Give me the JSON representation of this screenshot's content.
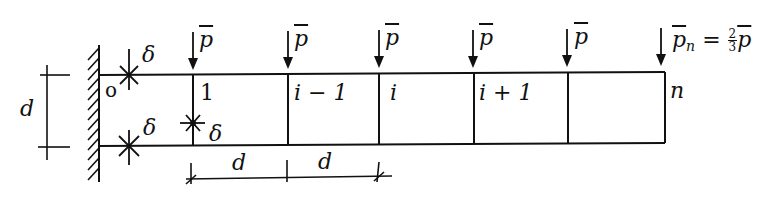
{
  "figure": {
    "wall_label": "o",
    "height_dim_label": "d",
    "spacing_dim_labels": [
      "d",
      "d"
    ],
    "gap_symbol": "δ",
    "gap_labels": [
      "δ",
      "δ",
      "δ"
    ],
    "load_symbol": "p",
    "node_labels": [
      "1",
      "i − 1",
      "i",
      "i + 1",
      "n"
    ],
    "end_load": {
      "symbol": "p",
      "subscript": "n",
      "equals": "=",
      "frac_num": "2",
      "frac_den": "3",
      "rhs_symbol": "p"
    },
    "loads_count": 6
  }
}
